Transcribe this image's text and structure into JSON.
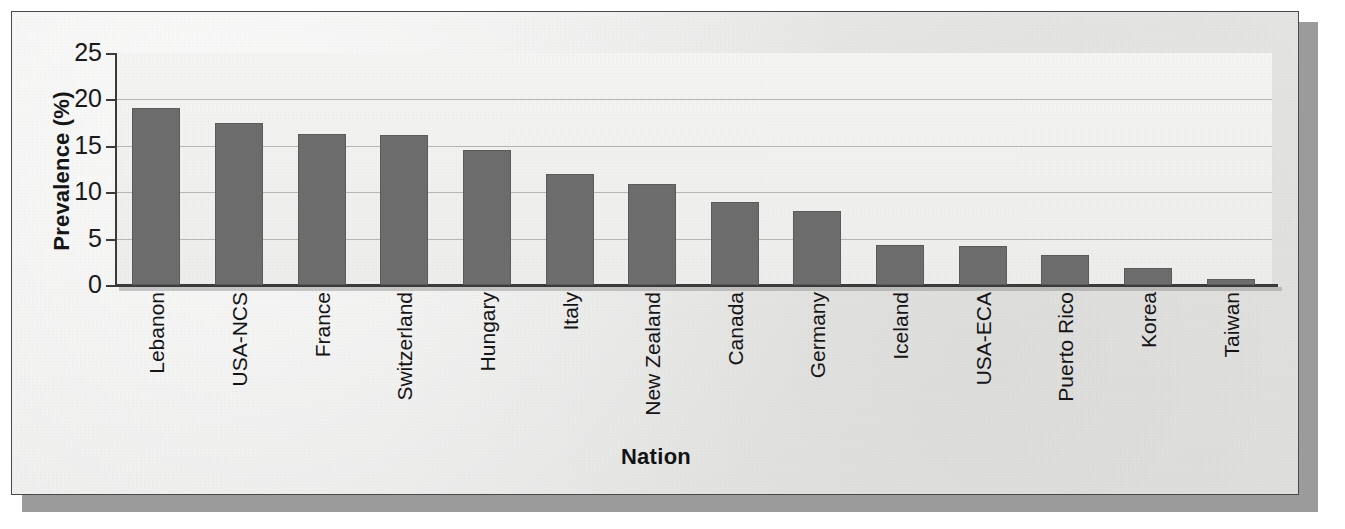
{
  "figure": {
    "background_color": "#ebebea",
    "frame_color": "#4a4a4a",
    "shadow_color": "#9b9b9b"
  },
  "chart_data": {
    "type": "bar",
    "title": "",
    "subtitle": "",
    "xlabel": "Nation",
    "ylabel": "Prevalence (%)",
    "categories": [
      "Lebanon",
      "USA-NCS",
      "France",
      "Switzerland",
      "Hungary",
      "Italy",
      "New Zealand",
      "Canada",
      "Germany",
      "Iceland",
      "USA-ECA",
      "Puerto Rico",
      "Korea",
      "Taiwan"
    ],
    "values": [
      19.1,
      17.5,
      16.3,
      16.2,
      14.6,
      12.0,
      10.9,
      8.9,
      8.0,
      4.3,
      4.2,
      3.2,
      1.8,
      0.6
    ],
    "ylim": [
      0,
      25
    ],
    "yticks": [
      0,
      5,
      10,
      15,
      20,
      25
    ],
    "ytick_labels": [
      "0",
      "5",
      "10",
      "15",
      "20",
      "25"
    ],
    "grid": true,
    "grid_axis": "y",
    "legend": false,
    "legend_position": "none",
    "bar_color": "#6d6d6d",
    "bar_edge_color": "#5b5b5b",
    "axis_color": "#3b3b3b",
    "gridline_color": "#b6b6b3",
    "series": [
      {
        "name": "Prevalence",
        "values": [
          19.1,
          17.5,
          16.3,
          16.2,
          14.6,
          12.0,
          10.9,
          8.9,
          8.0,
          4.3,
          4.2,
          3.2,
          1.8,
          0.6
        ]
      }
    ]
  }
}
